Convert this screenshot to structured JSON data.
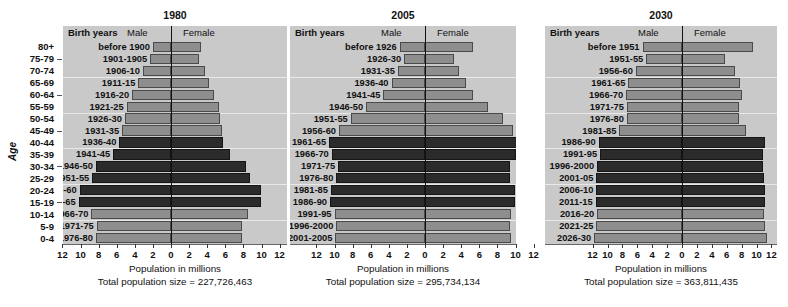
{
  "figure": {
    "age_axis_title": "Age",
    "age_categories": [
      "80+",
      "75-79",
      "70-74",
      "65-69",
      "60-64",
      "55-59",
      "50-54",
      "45-49",
      "40-44",
      "35-39",
      "30-34",
      "25-29",
      "20-24",
      "15-19",
      "10-14",
      "5-9",
      "0-4"
    ],
    "age_dash_indices": [
      1,
      4,
      7,
      10,
      13
    ],
    "column_headers": {
      "birth_years": "Birth years",
      "male": "Male",
      "female": "Female"
    },
    "xlabel": "Population in millions",
    "total_prefix": "Total population size = ",
    "xticks": [
      12,
      10,
      8,
      6,
      4,
      2,
      0,
      2,
      4,
      6,
      8,
      10,
      12
    ],
    "xlim": [
      -12,
      12
    ],
    "colors": {
      "plot_background": "#c9c9c9",
      "bar_light": "#8e8e8e",
      "bar_dark": "#2b2b2b",
      "bar_outline": "#4a4a4a",
      "gridline": "#eeeeee",
      "zero_line": "#111111"
    },
    "footnote": ""
  },
  "chart_data": {
    "type": "bar",
    "xlabel": "Population in millions",
    "ylabel": "Age",
    "xlim": [
      -12,
      12
    ],
    "grid": true,
    "legend": [
      "Male",
      "Female"
    ],
    "legend_position": "top",
    "categories": [
      "80+",
      "75-79",
      "70-74",
      "65-69",
      "60-64",
      "55-59",
      "50-54",
      "45-49",
      "40-44",
      "35-39",
      "30-34",
      "25-29",
      "20-24",
      "15-19",
      "10-14",
      "5-9",
      "0-4"
    ],
    "panels": [
      {
        "name": "1980",
        "total_population": "227,726,463",
        "birth_years": [
          "before 1900",
          "1901-1905",
          "1906-10",
          "1911-15",
          "1916-20",
          "1921-25",
          "1926-30",
          "1931-35",
          "1936-40",
          "1941-45",
          "1946-50",
          "1951-55",
          "1956-60",
          "1961-65",
          "1966-70",
          "1971-75",
          "1976-80"
        ],
        "series": [
          {
            "name": "Male",
            "values": [
              2.0,
              2.3,
              3.1,
              3.6,
              4.3,
              4.9,
              5.1,
              5.4,
              5.7,
              6.4,
              8.3,
              8.7,
              10.1,
              10.2,
              8.8,
              8.2,
              8.3
            ]
          },
          {
            "name": "Female",
            "values": [
              3.3,
              3.1,
              3.8,
              4.2,
              4.8,
              5.3,
              5.4,
              5.6,
              5.8,
              6.5,
              8.3,
              8.7,
              9.9,
              9.9,
              8.5,
              7.9,
              7.9
            ]
          }
        ],
        "highlight_indices": [
          8,
          9,
          10,
          11,
          12,
          13
        ]
      },
      {
        "name": "2005",
        "total_population": "295,734,134",
        "birth_years": [
          "before 1926",
          "1926-30",
          "1931-35",
          "1936-40",
          "1941-45",
          "1946-50",
          "1951-55",
          "1956-60",
          "1961-65",
          "1966-70",
          "1971-75",
          "1976-80",
          "1981-85",
          "1986-90",
          "1991-95",
          "1996-2000",
          "2001-2005"
        ],
        "series": [
          {
            "name": "Male",
            "values": [
              2.8,
              2.3,
              3.0,
              3.7,
              4.6,
              6.5,
              8.2,
              9.5,
              10.6,
              10.3,
              9.6,
              9.8,
              10.4,
              10.5,
              10.0,
              9.8,
              9.9
            ]
          },
          {
            "name": "Female",
            "values": [
              5.3,
              3.2,
              3.8,
              4.5,
              5.3,
              7.0,
              8.6,
              9.7,
              10.6,
              10.1,
              9.4,
              9.4,
              9.9,
              9.9,
              9.5,
              9.4,
              9.5
            ]
          }
        ],
        "highlight_indices": [
          8,
          9,
          10,
          11,
          12,
          13
        ]
      },
      {
        "name": "2030",
        "total_population": "363,811,435",
        "birth_years": [
          "before 1951",
          "1951-55",
          "1956-60",
          "1961-65",
          "1966-70",
          "1971-75",
          "1976-80",
          "1981-85",
          "1986-90",
          "1991-95",
          "1996-2000",
          "2001-05",
          "2006-10",
          "2011-15",
          "2016-20",
          "2021-25",
          "2026-30"
        ],
        "series": [
          {
            "name": "Male",
            "values": [
              5.3,
              4.8,
              6.2,
              7.2,
              7.5,
              7.4,
              7.4,
              8.4,
              11.2,
              11.0,
              11.4,
              11.5,
              11.5,
              11.6,
              11.4,
              11.5,
              11.8
            ]
          },
          {
            "name": "Female",
            "values": [
              9.5,
              5.8,
              7.1,
              7.8,
              8.0,
              7.7,
              7.6,
              8.6,
              11.2,
              10.9,
              10.9,
              11.0,
              11.1,
              11.2,
              11.0,
              11.1,
              11.4
            ]
          }
        ],
        "highlight_indices": [
          8,
          9,
          10,
          11,
          12,
          13
        ]
      }
    ]
  }
}
